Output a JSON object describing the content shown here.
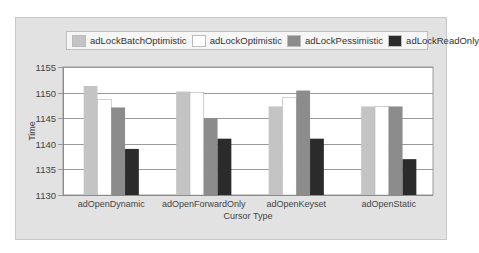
{
  "chart_data": {
    "type": "bar",
    "title": "",
    "xlabel": "Cursor Type",
    "ylabel": "Time",
    "ylim": [
      1130,
      1155
    ],
    "yticks": [
      1130,
      1135,
      1140,
      1145,
      1150,
      1155
    ],
    "grid": true,
    "legend_position": "top",
    "categories": [
      "adOpenDynamic",
      "adOpenForwardOnly",
      "adOpenKeyset",
      "adOpenStatic"
    ],
    "series": [
      {
        "name": "adLockBatchOptimistic",
        "color": "#c4c4c4",
        "values": [
          1151.3,
          1150.2,
          1147.3,
          1147.3
        ]
      },
      {
        "name": "adLockOptimistic",
        "color": "#ffffff",
        "values": [
          1148.7,
          1150.0,
          1149.0,
          1147.3
        ]
      },
      {
        "name": "adLockPessimistic",
        "color": "#8c8c8c",
        "values": [
          1147.1,
          1145.0,
          1150.4,
          1147.3
        ]
      },
      {
        "name": "adLockReadOnly",
        "color": "#2b2b2b",
        "values": [
          1139.0,
          1141.0,
          1141.0,
          1137.0
        ]
      }
    ]
  }
}
